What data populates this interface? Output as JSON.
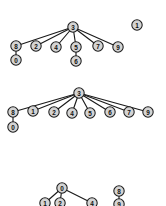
{
  "figure": {
    "title": "",
    "background_color": "#ffffff",
    "node_fill": "#d4d4d4",
    "node_stroke": "#1c1c1c",
    "edge_color": "#1a1a1a",
    "label_color": "#101010",
    "node_radius": 5.2,
    "width": 166,
    "height": 206
  },
  "chart_data": {
    "type": "diagram",
    "diagram_kind": "node-link-graph",
    "title": "",
    "panels": [
      {
        "panel_id": "graph-1",
        "label": "",
        "nodes": [
          {
            "id": "3",
            "label": "3",
            "x": 73,
            "y": 27
          },
          {
            "id": "8",
            "label": "8",
            "x": 16,
            "y": 46
          },
          {
            "id": "2",
            "label": "2",
            "x": 36,
            "y": 46
          },
          {
            "id": "4",
            "label": "4",
            "x": 56,
            "y": 47
          },
          {
            "id": "5",
            "label": "5",
            "x": 76,
            "y": 47
          },
          {
            "id": "7",
            "label": "7",
            "x": 98,
            "y": 46
          },
          {
            "id": "9",
            "label": "9",
            "x": 118,
            "y": 47
          },
          {
            "id": "0",
            "label": "0",
            "x": 16,
            "y": 60
          },
          {
            "id": "6",
            "label": "6",
            "x": 76,
            "y": 61
          },
          {
            "id": "1",
            "label": "1",
            "x": 137,
            "y": 25
          }
        ],
        "edges": [
          {
            "source": "3",
            "target": "8"
          },
          {
            "source": "3",
            "target": "2"
          },
          {
            "source": "3",
            "target": "4"
          },
          {
            "source": "3",
            "target": "5"
          },
          {
            "source": "3",
            "target": "7"
          },
          {
            "source": "3",
            "target": "9"
          },
          {
            "source": "8",
            "target": "0"
          },
          {
            "source": "5",
            "target": "6"
          }
        ],
        "isolated_nodes": [
          "1"
        ]
      },
      {
        "panel_id": "graph-2",
        "label": "",
        "nodes": [
          {
            "id": "3",
            "label": "3",
            "x": 79,
            "y": 93
          },
          {
            "id": "8",
            "label": "8",
            "x": 13,
            "y": 112
          },
          {
            "id": "1",
            "label": "1",
            "x": 33,
            "y": 111
          },
          {
            "id": "2",
            "label": "2",
            "x": 54,
            "y": 112
          },
          {
            "id": "4",
            "label": "4",
            "x": 72,
            "y": 113
          },
          {
            "id": "5",
            "label": "5",
            "x": 90,
            "y": 113
          },
          {
            "id": "6",
            "label": "6",
            "x": 110,
            "y": 112
          },
          {
            "id": "7",
            "label": "7",
            "x": 129,
            "y": 112
          },
          {
            "id": "9",
            "label": "9",
            "x": 148,
            "y": 112
          },
          {
            "id": "0",
            "label": "0",
            "x": 13,
            "y": 127
          }
        ],
        "edges": [
          {
            "source": "3",
            "target": "8"
          },
          {
            "source": "3",
            "target": "1"
          },
          {
            "source": "3",
            "target": "2"
          },
          {
            "source": "3",
            "target": "4"
          },
          {
            "source": "3",
            "target": "5"
          },
          {
            "source": "3",
            "target": "6"
          },
          {
            "source": "3",
            "target": "7"
          },
          {
            "source": "3",
            "target": "9"
          },
          {
            "source": "8",
            "target": "0"
          }
        ],
        "isolated_nodes": []
      },
      {
        "panel_id": "graph-3",
        "label": "",
        "clipped": true,
        "nodes": [
          {
            "id": "0",
            "label": "0",
            "x": 62,
            "y": 188
          },
          {
            "id": "1",
            "label": "1",
            "x": 45,
            "y": 203
          },
          {
            "id": "2",
            "label": "2",
            "x": 60,
            "y": 203
          },
          {
            "id": "4",
            "label": "4",
            "x": 92,
            "y": 203
          },
          {
            "id": "8",
            "label": "8",
            "x": 119,
            "y": 191
          },
          {
            "id": "9",
            "label": "9",
            "x": 119,
            "y": 204
          }
        ],
        "edges": [
          {
            "source": "0",
            "target": "1"
          },
          {
            "source": "0",
            "target": "2"
          },
          {
            "source": "0",
            "target": "4"
          },
          {
            "source": "8",
            "target": "9"
          }
        ],
        "isolated_nodes": []
      }
    ]
  }
}
